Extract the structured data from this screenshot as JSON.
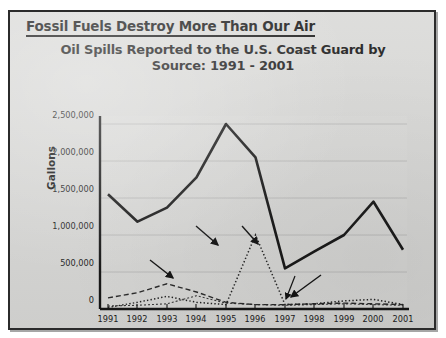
{
  "header": {
    "text": "Fossil Fuels Destroy More Than Our Air"
  },
  "chart_title": {
    "line1": "Oil Spills Reported to the U.S. Coast Guard by",
    "line2": "Source: 1991 - 2001"
  },
  "axis": {
    "ylabel": "Gallons",
    "yticks": [
      "0",
      "500,000",
      "1,000,000",
      "1,500,000",
      "2,000,000",
      "2,500,000"
    ],
    "xticks": [
      "1991",
      "1992",
      "1993",
      "1994",
      "1995",
      "1996",
      "1997",
      "1998",
      "1999",
      "2000",
      "2001"
    ]
  },
  "annotations": {
    "maritime": "Maritime",
    "all_other_transportation": "All other transportation",
    "unknown_and_other": "Unknown and other",
    "nontransportation": "Nontransportation"
  },
  "colors": {
    "slide_background": "#d9d9d7",
    "border": "#2b2b2b",
    "line": "#1a1a1a",
    "gridline": "#b8b8b6",
    "text": "#111111"
  },
  "chart_data": {
    "type": "line",
    "title": "Oil Spills Reported to the U.S. Coast Guard by Source: 1991 - 2001",
    "xlabel": "",
    "ylabel": "Gallons",
    "ylim": [
      0,
      2500000
    ],
    "xlim": [
      "1991",
      "2001"
    ],
    "grid": true,
    "legend": "inline-annotations",
    "categories": [
      "1991",
      "1992",
      "1993",
      "1994",
      "1995",
      "1996",
      "1997",
      "1998",
      "1999",
      "2000",
      "2001"
    ],
    "series": [
      {
        "name": "Maritime",
        "style": "solid-bold",
        "values": [
          1550000,
          1180000,
          1370000,
          1780000,
          2500000,
          2050000,
          550000,
          780000,
          1000000,
          1450000,
          800000
        ]
      },
      {
        "name": "All other transportation",
        "style": "dotted",
        "values": [
          20000,
          90000,
          170000,
          90000,
          60000,
          1000000,
          60000,
          70000,
          110000,
          130000,
          60000
        ]
      },
      {
        "name": "Unknown and other",
        "style": "dashed",
        "values": [
          150000,
          220000,
          340000,
          230000,
          90000,
          60000,
          60000,
          70000,
          80000,
          70000,
          60000
        ]
      },
      {
        "name": "Nontransportation",
        "style": "thin-dashed",
        "values": [
          40000,
          50000,
          70000,
          180000,
          80000,
          60000,
          50000,
          60000,
          70000,
          60000,
          50000
        ]
      }
    ]
  }
}
